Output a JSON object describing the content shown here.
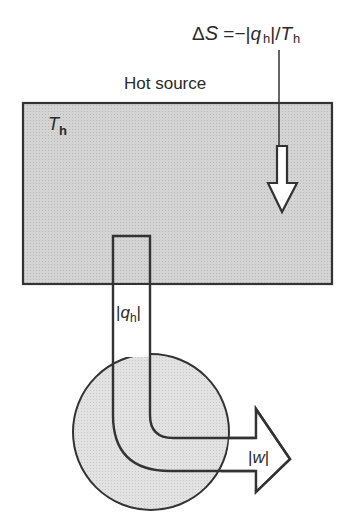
{
  "diagram": {
    "type": "heat-engine-schematic",
    "entropy_label": {
      "delta": "Δ",
      "S": "S",
      "equals": " =−|",
      "q": "q",
      "sub_h1": "h",
      "slash": "|/",
      "T": "T",
      "sub_h2": "h"
    },
    "hot_source": {
      "title": "Hot source",
      "temperature_symbol": "T",
      "temperature_subscript": "h",
      "fill_color": "#cfcfcf"
    },
    "heat_flow_label": {
      "bar_open": "|",
      "q": "q",
      "subscript": "h",
      "bar_close": "|"
    },
    "work_label": {
      "bar_open": "|",
      "w": "w",
      "bar_close": "|"
    },
    "engine": {
      "shape": "circle",
      "fill_color": "#dedede"
    },
    "colors": {
      "stroke": "#333333",
      "background": "#ffffff"
    }
  }
}
